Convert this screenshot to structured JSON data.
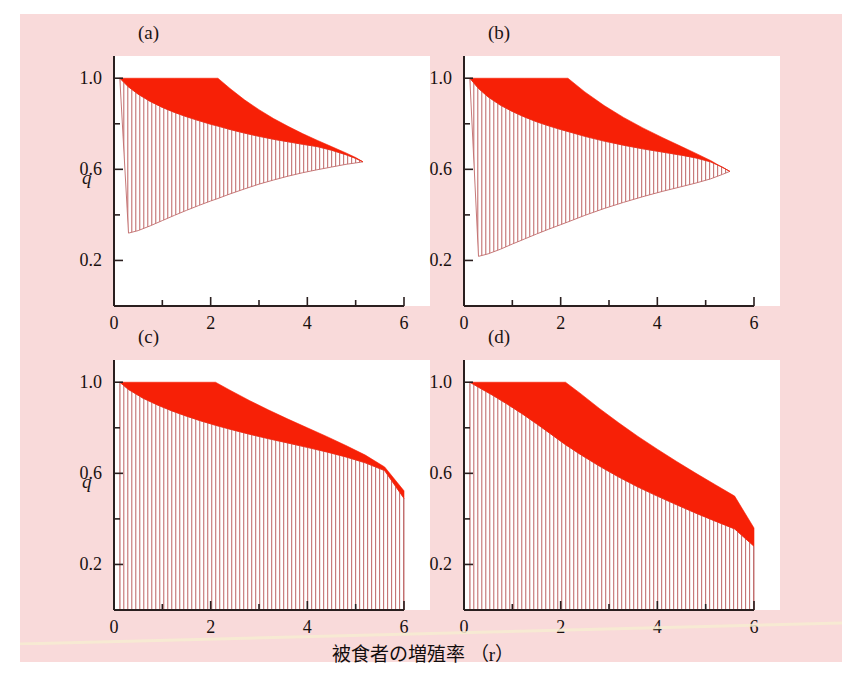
{
  "figure": {
    "background_color": "#f9dada",
    "page_color": "#ffffff",
    "band_color": "#f72006",
    "hatch_color": "#c06a6a",
    "axis_color": "#2a1f1f",
    "xlabel": "被食者の増殖率 （r）",
    "ylabel": "q"
  },
  "panels": [
    {
      "key": "a",
      "label": "(a)"
    },
    {
      "key": "b",
      "label": "(b)"
    },
    {
      "key": "c",
      "label": "(c)"
    },
    {
      "key": "d",
      "label": "(d)"
    }
  ],
  "axes": {
    "x_ticks": [
      "0",
      "1",
      "2",
      "3",
      "4",
      "5",
      "6"
    ],
    "x_tick_labels": [
      "0",
      "",
      "2",
      "",
      "4",
      "",
      "6"
    ],
    "y_ticks": [
      "0.2",
      "0.4",
      "0.6",
      "0.8",
      "1.0"
    ],
    "y_tick_labels": [
      "0.2",
      "",
      "0.6",
      "",
      "1.0"
    ],
    "xlim": [
      0,
      6
    ],
    "ylim": [
      0,
      1.08
    ]
  },
  "chart_data": {
    "type": "area",
    "title": "",
    "xlabel": "被食者の増殖率 （r）",
    "ylabel": "q",
    "xlim": [
      0,
      6
    ],
    "ylim": [
      0,
      1.08
    ],
    "grid": false,
    "legend": null,
    "shared_axes": {
      "x_tick_values": [
        0,
        1,
        2,
        3,
        4,
        5,
        6
      ],
      "x_labeled": [
        0,
        2,
        4,
        6
      ],
      "y_tick_values": [
        0.2,
        0.4,
        0.6,
        0.8,
        1.0
      ],
      "y_labeled": [
        0.2,
        0.6,
        1.0
      ]
    },
    "panels": [
      {
        "name": "(a)",
        "x": [
          0.12,
          0.3,
          0.5,
          0.75,
          1.0,
          1.25,
          1.5,
          1.75,
          2.0,
          2.15,
          2.4,
          2.7,
          3.0,
          3.3,
          3.6,
          3.9,
          4.2,
          4.5,
          4.8,
          5.0,
          5.15
        ],
        "band_upper": [
          1.0,
          1.0,
          1.0,
          1.0,
          1.0,
          1.0,
          1.0,
          1.0,
          1.0,
          1.0,
          0.955,
          0.905,
          0.862,
          0.823,
          0.789,
          0.757,
          0.728,
          0.7,
          0.672,
          0.652,
          0.633
        ],
        "band_lower": [
          1.0,
          0.962,
          0.93,
          0.898,
          0.872,
          0.85,
          0.831,
          0.814,
          0.798,
          0.79,
          0.775,
          0.759,
          0.745,
          0.732,
          0.721,
          0.71,
          0.7,
          0.684,
          0.664,
          0.648,
          0.633
        ],
        "hatch_upper": [
          1.0,
          0.962,
          0.93,
          0.898,
          0.872,
          0.85,
          0.831,
          0.814,
          0.798,
          0.79,
          0.775,
          0.759,
          0.745,
          0.732,
          0.721,
          0.71,
          0.7,
          0.684,
          0.664,
          0.648,
          0.633
        ],
        "hatch_lower": [
          1.0,
          0.32,
          0.331,
          0.352,
          0.375,
          0.398,
          0.42,
          0.441,
          0.461,
          0.472,
          0.492,
          0.514,
          0.535,
          0.553,
          0.57,
          0.585,
          0.598,
          0.61,
          0.622,
          0.628,
          0.633
        ],
        "wedge_tip": [
          5.15,
          0.633
        ],
        "hatch_left_bottom": 0.314
      },
      {
        "name": "(b)",
        "x": [
          0.12,
          0.3,
          0.5,
          0.75,
          1.0,
          1.25,
          1.5,
          1.75,
          2.0,
          2.15,
          2.5,
          2.9,
          3.3,
          3.7,
          4.1,
          4.5,
          4.8,
          5.1,
          5.35,
          5.5
        ],
        "band_upper": [
          1.0,
          1.0,
          1.0,
          1.0,
          1.0,
          1.0,
          1.0,
          1.0,
          1.0,
          1.0,
          0.94,
          0.88,
          0.828,
          0.782,
          0.74,
          0.7,
          0.67,
          0.639,
          0.608,
          0.591
        ],
        "band_lower": [
          1.0,
          0.955,
          0.918,
          0.882,
          0.854,
          0.83,
          0.809,
          0.791,
          0.775,
          0.766,
          0.745,
          0.724,
          0.706,
          0.69,
          0.676,
          0.662,
          0.65,
          0.633,
          0.609,
          0.591
        ],
        "hatch_upper": [
          1.0,
          0.955,
          0.918,
          0.882,
          0.854,
          0.83,
          0.809,
          0.791,
          0.775,
          0.766,
          0.745,
          0.724,
          0.706,
          0.69,
          0.676,
          0.662,
          0.65,
          0.633,
          0.609,
          0.591
        ],
        "hatch_lower": [
          1.0,
          0.218,
          0.229,
          0.249,
          0.272,
          0.294,
          0.316,
          0.337,
          0.357,
          0.369,
          0.398,
          0.428,
          0.455,
          0.48,
          0.503,
          0.524,
          0.54,
          0.558,
          0.578,
          0.591
        ],
        "wedge_tip": [
          5.5,
          0.591
        ],
        "hatch_left_bottom": 0.212
      },
      {
        "name": "(c)",
        "x": [
          0.12,
          0.3,
          0.6,
          0.9,
          1.2,
          1.5,
          1.8,
          2.1,
          2.4,
          2.8,
          3.2,
          3.6,
          4.0,
          4.4,
          4.8,
          5.2,
          5.6,
          6.0
        ],
        "band_upper": [
          1.0,
          1.0,
          1.0,
          1.0,
          1.0,
          1.0,
          1.0,
          1.0,
          0.965,
          0.92,
          0.878,
          0.838,
          0.8,
          0.762,
          0.722,
          0.68,
          0.628,
          0.523
        ],
        "band_lower": [
          1.0,
          0.968,
          0.93,
          0.9,
          0.874,
          0.851,
          0.83,
          0.811,
          0.794,
          0.772,
          0.752,
          0.733,
          0.714,
          0.694,
          0.672,
          0.646,
          0.612,
          0.49
        ],
        "hatch_upper": [
          1.0,
          0.968,
          0.93,
          0.9,
          0.874,
          0.851,
          0.83,
          0.811,
          0.794,
          0.772,
          0.752,
          0.733,
          0.714,
          0.694,
          0.672,
          0.646,
          0.612,
          0.49
        ],
        "hatch_lower": [
          0,
          0,
          0,
          0,
          0,
          0,
          0,
          0,
          0,
          0,
          0,
          0,
          0,
          0,
          0,
          0,
          0,
          0
        ],
        "right_edge_band": [
          0.49,
          0.523
        ]
      },
      {
        "name": "(d)",
        "x": [
          0.12,
          0.3,
          0.6,
          0.9,
          1.2,
          1.5,
          1.8,
          2.1,
          2.4,
          2.8,
          3.2,
          3.6,
          4.0,
          4.4,
          4.8,
          5.2,
          5.6,
          6.0
        ],
        "band_upper": [
          1.0,
          1.0,
          1.0,
          1.0,
          1.0,
          1.0,
          1.0,
          1.0,
          0.952,
          0.885,
          0.822,
          0.762,
          0.706,
          0.652,
          0.6,
          0.55,
          0.5,
          0.36
        ],
        "band_lower": [
          1.0,
          0.978,
          0.942,
          0.903,
          0.862,
          0.818,
          0.772,
          0.726,
          0.684,
          0.632,
          0.584,
          0.54,
          0.5,
          0.462,
          0.425,
          0.39,
          0.356,
          0.28
        ],
        "hatch_upper": [
          1.0,
          0.978,
          0.942,
          0.903,
          0.862,
          0.818,
          0.772,
          0.726,
          0.684,
          0.632,
          0.584,
          0.54,
          0.5,
          0.462,
          0.425,
          0.39,
          0.356,
          0.28
        ],
        "hatch_lower": [
          0,
          0,
          0,
          0,
          0,
          0,
          0,
          0,
          0,
          0,
          0,
          0,
          0,
          0,
          0,
          0,
          0,
          0
        ],
        "right_edge_band": [
          0.28,
          0.36
        ]
      }
    ]
  }
}
